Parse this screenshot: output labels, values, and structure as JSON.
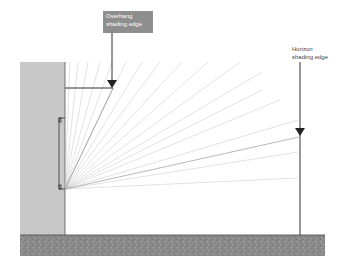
{
  "diagram": {
    "title": "",
    "labels": {
      "overhang": "Overhang shading edge",
      "horizon": "Horizon shading edge"
    },
    "elements": {
      "wall": {
        "color": "#c8c8c8"
      },
      "ground": {
        "color": "#8a8a8a"
      },
      "label_box": {
        "color": "#8e8e8e"
      },
      "ray_color": "#bdbdbd",
      "line_color": "#333333"
    }
  }
}
